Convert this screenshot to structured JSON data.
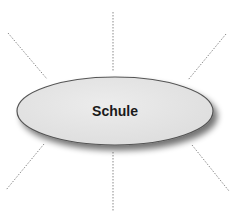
{
  "diagram": {
    "type": "mind-map",
    "center_node": {
      "label": "Schule",
      "fill": "#e4e4e4",
      "stroke": "#555555"
    },
    "connector_color": "#8a8a8a",
    "connectors": [
      {
        "name": "connector-top-left",
        "x1": 8,
        "y1": 33,
        "x2": 47,
        "y2": 79
      },
      {
        "name": "connector-top",
        "x1": 113,
        "y1": 12,
        "x2": 113,
        "y2": 71
      },
      {
        "name": "connector-top-right",
        "x1": 226,
        "y1": 34,
        "x2": 188,
        "y2": 80
      },
      {
        "name": "connector-bottom-left",
        "x1": 44,
        "y1": 144,
        "x2": 6,
        "y2": 190
      },
      {
        "name": "connector-bottom",
        "x1": 113,
        "y1": 152,
        "x2": 113,
        "y2": 211
      },
      {
        "name": "connector-bottom-right",
        "x1": 192,
        "y1": 145,
        "x2": 229,
        "y2": 191
      }
    ]
  }
}
